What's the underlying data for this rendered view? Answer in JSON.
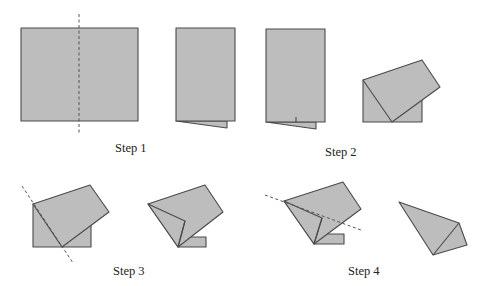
{
  "colors": {
    "paper_fill": "#bdbdbd",
    "paper_edge": "#4a4a4a",
    "background": "#ffffff"
  },
  "steps": [
    {
      "label": "Step 1",
      "x": 115,
      "y": 142
    },
    {
      "label": "Step 2",
      "x": 325,
      "y": 146
    },
    {
      "label": "Step 3",
      "x": 113,
      "y": 265
    },
    {
      "label": "Step 4",
      "x": 348,
      "y": 265
    }
  ],
  "figures": [
    {
      "name": "square-sheet",
      "step": 1,
      "polygons": [
        "21,28 138,28 138,121 21,121"
      ],
      "fold_lines": [
        "79,14 79,135"
      ],
      "creases": []
    },
    {
      "name": "half-folded-sheet",
      "step": 2,
      "polygons": [
        "176,121 227,128 227,121",
        "176,28 235,28 235,121 176,121"
      ],
      "fold_lines": [],
      "creases": []
    },
    {
      "name": "half-folded-sheet-creased",
      "step": 2,
      "polygons": [
        "266,122 316,129 316,122",
        "266,29 325,29 325,122 266,122"
      ],
      "fold_lines": [],
      "creases": [
        "296,117 296,122"
      ]
    },
    {
      "name": "rotated-flap",
      "step": 2,
      "polygons": [
        "363,80 422,80 422,122 363,122",
        "363,80 422,60 440,87 392,122"
      ],
      "fold_lines": [],
      "creases": []
    },
    {
      "name": "flap-with-diagonal-fold",
      "step": 3,
      "polygons": [
        "33,204 91,204 91,247 33,247",
        "33,204 90,185 109,212 62,247"
      ],
      "fold_lines": [
        "22,186 73,263"
      ],
      "creases": []
    },
    {
      "name": "flap-folded-inward",
      "step": 3,
      "polygons": [
        "178,237 206,237 206,247 178,247",
        "148,204 205,185 223,212 178,247",
        "148,204 185,221 178,247"
      ],
      "fold_lines": [],
      "creases": [
        "185,221 178,247"
      ]
    },
    {
      "name": "kite-with-fold-line",
      "step": 4,
      "polygons": [
        "314,234 344,234 344,244 314,244",
        "284,201 343,182 361,209 314,244",
        "284,201 322,218 314,244"
      ],
      "fold_lines": [
        "265,195 361,230"
      ],
      "creases": [
        "322,218 314,244",
        "322,218 343,222"
      ]
    },
    {
      "name": "finished-kite",
      "step": 4,
      "polygons": [
        "399,202 459,223 467,245 433,255"
      ],
      "fold_lines": [],
      "creases": [
        "459,223 433,255"
      ]
    }
  ]
}
